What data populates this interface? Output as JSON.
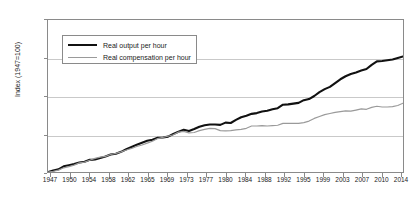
{
  "chart_data": {
    "type": "line",
    "title": "",
    "xlabel": "",
    "ylabel": "Index (1947=100)",
    "ylim": [
      100,
      500
    ],
    "yticks": [
      100,
      200,
      300,
      400,
      500
    ],
    "xlim": [
      1947,
      2015
    ],
    "grid": true,
    "legend_position": "top-left",
    "xticks": [
      1947,
      1950,
      1954,
      1958,
      1962,
      1965,
      1969,
      1973,
      1977,
      1980,
      1984,
      1988,
      1992,
      1995,
      1999,
      2003,
      2007,
      2010,
      2014
    ],
    "colors": {
      "output": "#111111",
      "compensation": "#9a9a9a"
    },
    "series": [
      {
        "name": "Real output per hour",
        "color": "#111111",
        "x": [
          1947,
          1948,
          1949,
          1950,
          1951,
          1952,
          1953,
          1954,
          1955,
          1956,
          1957,
          1958,
          1959,
          1960,
          1961,
          1962,
          1963,
          1964,
          1965,
          1966,
          1967,
          1968,
          1969,
          1970,
          1971,
          1972,
          1973,
          1974,
          1975,
          1976,
          1977,
          1978,
          1979,
          1980,
          1981,
          1982,
          1983,
          1984,
          1985,
          1986,
          1987,
          1988,
          1989,
          1990,
          1991,
          1992,
          1993,
          1994,
          1995,
          1996,
          1997,
          1998,
          1999,
          2000,
          2001,
          2002,
          2003,
          2004,
          2005,
          2006,
          2007,
          2008,
          2009,
          2010,
          2011,
          2012,
          2013,
          2014,
          2015
        ],
        "values": [
          100,
          104,
          107,
          115,
          118,
          121,
          125,
          127,
          132,
          133,
          137,
          141,
          146,
          148,
          153,
          160,
          166,
          172,
          177,
          182,
          185,
          190,
          191,
          193,
          200,
          206,
          211,
          208,
          213,
          219,
          223,
          225,
          225,
          224,
          230,
          229,
          237,
          244,
          248,
          253,
          255,
          259,
          261,
          265,
          268,
          277,
          278,
          280,
          282,
          289,
          292,
          300,
          310,
          318,
          324,
          334,
          344,
          352,
          358,
          362,
          367,
          371,
          382,
          391,
          392,
          394,
          396,
          400,
          404
        ],
        "note": "black thick line"
      },
      {
        "name": "Real compensation per hour",
        "color": "#9a9a9a",
        "x": [
          1947,
          1948,
          1949,
          1950,
          1951,
          1952,
          1953,
          1954,
          1955,
          1956,
          1957,
          1958,
          1959,
          1960,
          1961,
          1962,
          1963,
          1964,
          1965,
          1966,
          1967,
          1968,
          1969,
          1970,
          1971,
          1972,
          1973,
          1974,
          1975,
          1976,
          1977,
          1978,
          1979,
          1980,
          1981,
          1982,
          1983,
          1984,
          1985,
          1986,
          1987,
          1988,
          1989,
          1990,
          1991,
          1992,
          1993,
          1994,
          1995,
          1996,
          1997,
          1998,
          1999,
          2000,
          2001,
          2002,
          2003,
          2004,
          2005,
          2006,
          2007,
          2008,
          2009,
          2010,
          2011,
          2012,
          2013,
          2014,
          2015
        ],
        "values": [
          100,
          102,
          105,
          111,
          114,
          118,
          124,
          126,
          131,
          136,
          139,
          141,
          146,
          149,
          153,
          158,
          162,
          167,
          171,
          176,
          181,
          188,
          191,
          194,
          198,
          205,
          207,
          203,
          204,
          209,
          212,
          215,
          214,
          209,
          208,
          209,
          211,
          212,
          215,
          221,
          221,
          222,
          221,
          222,
          223,
          228,
          228,
          228,
          228,
          230,
          234,
          241,
          246,
          251,
          254,
          257,
          259,
          261,
          260,
          263,
          266,
          265,
          270,
          273,
          271,
          271,
          272,
          275,
          281
        ],
        "note": "gray thin line"
      }
    ]
  },
  "legend": {
    "items": [
      {
        "label": "Real output per hour",
        "style": "thick"
      },
      {
        "label": "Real compensation per hour",
        "style": "thin"
      }
    ]
  }
}
